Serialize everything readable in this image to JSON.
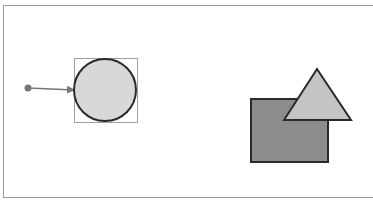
{
  "canvas": {
    "background": "#ffffff",
    "border_color": "#9a9a9a"
  },
  "shapes": {
    "connector_dot": {
      "cx": 28,
      "cy": 88,
      "r": 3.5,
      "fill": "#777777"
    },
    "connector_arrow": {
      "x1": 28,
      "y1": 88,
      "x2": 76,
      "y2": 90,
      "stroke": "#777777"
    },
    "selection_box": {
      "x": 74,
      "y": 58,
      "width": 63,
      "height": 64,
      "stroke": "#a0a0a0"
    },
    "circle": {
      "cx": 105,
      "cy": 90,
      "r": 31,
      "fill": "#d8d8d8",
      "stroke": "#2a2a2a"
    },
    "rectangle": {
      "x": 251,
      "y": 99,
      "width": 77,
      "height": 63,
      "fill": "#8c8c8c",
      "stroke": "#2a2a2a"
    },
    "triangle": {
      "points": "317,69 284,120 351,120",
      "fill": "#c4c4c4",
      "stroke": "#2a2a2a"
    }
  }
}
